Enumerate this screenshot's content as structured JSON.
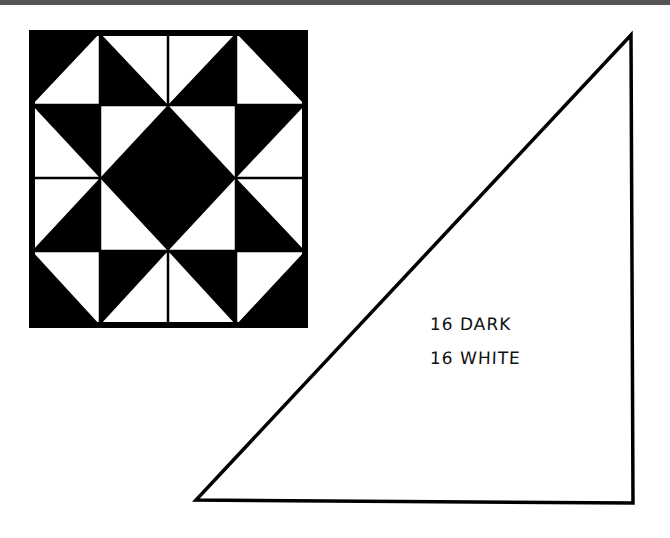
{
  "diagram": {
    "type": "quilt-pattern",
    "quilt_block": {
      "grid": 4,
      "colors": {
        "dark": "#000000",
        "light": "#ffffff"
      },
      "cells": [
        [
          {
            "base": "dark",
            "tri": "white",
            "corner": "br"
          },
          {
            "base": "white",
            "tri": "dark",
            "corner": "bl"
          },
          {
            "base": "white",
            "tri": "dark",
            "corner": "br"
          },
          {
            "base": "dark",
            "tri": "white",
            "corner": "bl"
          }
        ],
        [
          {
            "base": "white",
            "tri": "dark",
            "corner": "tr"
          },
          {
            "base": "white",
            "tri": "dark",
            "corner": "br"
          },
          {
            "base": "white",
            "tri": "dark",
            "corner": "bl"
          },
          {
            "base": "white",
            "tri": "dark",
            "corner": "tl"
          }
        ],
        [
          {
            "base": "white",
            "tri": "dark",
            "corner": "br"
          },
          {
            "base": "white",
            "tri": "dark",
            "corner": "tr"
          },
          {
            "base": "white",
            "tri": "dark",
            "corner": "tl"
          },
          {
            "base": "white",
            "tri": "dark",
            "corner": "bl"
          }
        ],
        [
          {
            "base": "dark",
            "tri": "white",
            "corner": "tr"
          },
          {
            "base": "white",
            "tri": "dark",
            "corner": "tl"
          },
          {
            "base": "white",
            "tri": "dark",
            "corner": "tr"
          },
          {
            "base": "dark",
            "tri": "white",
            "corner": "tl"
          }
        ]
      ]
    },
    "template_piece": {
      "shape": "right-triangle",
      "labels": [
        "16 DARK",
        "16 WHITE"
      ]
    }
  }
}
